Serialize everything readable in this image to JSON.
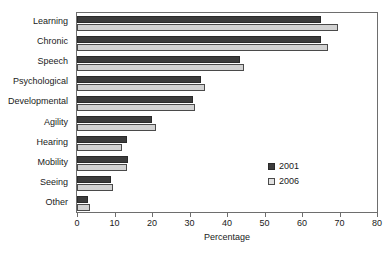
{
  "chart_data": {
    "type": "bar",
    "orientation": "horizontal",
    "title": "",
    "subtitle": "",
    "xlabel": "Percentage",
    "ylabel": "",
    "xlim": [
      0,
      80
    ],
    "xticks": [
      0,
      10,
      20,
      30,
      40,
      50,
      60,
      70,
      80
    ],
    "xtick_labels": [
      "0",
      "10",
      "20",
      "30",
      "40",
      "50",
      "60",
      "70",
      "80"
    ],
    "grid": false,
    "legend_position": "center-right",
    "categories": [
      "Learning",
      "Chronic",
      "Speech",
      "Psychological",
      "Developmental",
      "Agility",
      "Hearing",
      "Mobility",
      "Seeing",
      "Other"
    ],
    "series": [
      {
        "name": "2001",
        "color": "#3c3c3c",
        "values": [
          65.0,
          65.0,
          43.5,
          33.0,
          31.0,
          20.0,
          13.3,
          13.5,
          9.0,
          3.0
        ]
      },
      {
        "name": "2006",
        "color": "#d2d2d2",
        "values": [
          69.5,
          67.0,
          44.5,
          34.0,
          31.5,
          21.0,
          12.0,
          13.2,
          9.5,
          3.5
        ]
      }
    ]
  },
  "legend": {
    "items": [
      {
        "label": "2001",
        "series_key": "s2001"
      },
      {
        "label": "2006",
        "series_key": "s2006"
      }
    ]
  }
}
